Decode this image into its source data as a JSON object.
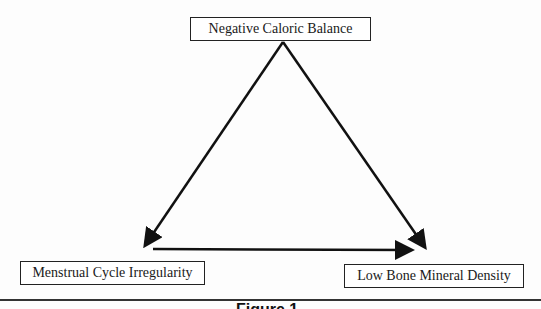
{
  "diagram": {
    "nodes": {
      "top": "Negative Caloric Balance",
      "left": "Menstrual Cycle Irregularity",
      "right": "Low Bone Mineral Density"
    },
    "edges": [
      {
        "from": "Negative Caloric Balance",
        "to": "Menstrual Cycle Irregularity"
      },
      {
        "from": "Negative Caloric Balance",
        "to": "Low Bone Mineral Density"
      },
      {
        "from": "Menstrual Cycle Irregularity",
        "to": "Low Bone Mineral Density"
      }
    ],
    "caption": "Figure 1"
  }
}
